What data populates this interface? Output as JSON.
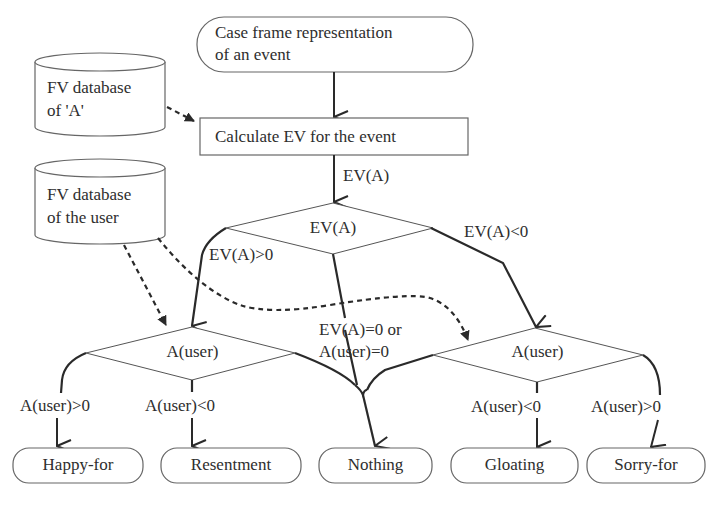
{
  "diagram": {
    "type": "flowchart",
    "nodes": {
      "start": {
        "label_line1": "Case frame representation",
        "label_line2": "of an event",
        "shape": "terminal"
      },
      "calc": {
        "label": "Calculate EV for the event",
        "shape": "process"
      },
      "db_a": {
        "label_line1": "FV database",
        "label_line2": "of 'A'",
        "shape": "database"
      },
      "db_user": {
        "label_line1": "FV database",
        "label_line2": "of the user",
        "shape": "database"
      },
      "decision_ev": {
        "label": "EV(A)",
        "shape": "decision"
      },
      "decision_user_left": {
        "label": "A(user)",
        "shape": "decision"
      },
      "decision_user_right": {
        "label": "A(user)",
        "shape": "decision"
      },
      "out_happy": {
        "label": "Happy-for",
        "shape": "terminal"
      },
      "out_resent": {
        "label": "Resentment",
        "shape": "terminal"
      },
      "out_nothing": {
        "label": "Nothing",
        "shape": "terminal"
      },
      "out_gloat": {
        "label": "Gloating",
        "shape": "terminal"
      },
      "out_sorry": {
        "label": "Sorry-for",
        "shape": "terminal"
      }
    },
    "edge_labels": {
      "calc_to_ev": "EV(A)",
      "ev_pos": "EV(A)>0",
      "ev_neg": "EV(A)<0",
      "zero_line1": "EV(A)=0 or",
      "zero_line2": "A(user)=0",
      "left_pos": "A(user)>0",
      "left_neg": "A(user)<0",
      "right_neg": "A(user)<0",
      "right_pos": "A(user)>0"
    },
    "colors": {
      "line": "#2a2a2a",
      "shape_stroke": "#555555",
      "background": "#ffffff"
    }
  }
}
